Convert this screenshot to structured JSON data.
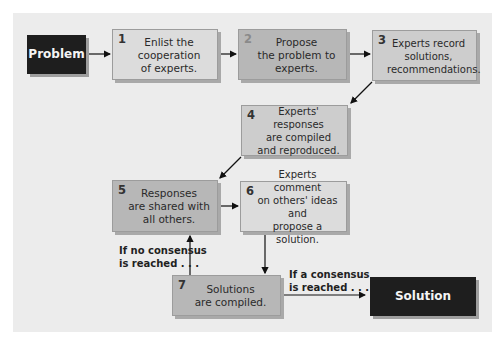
{
  "diagram": {
    "start": {
      "label": "Problem"
    },
    "end": {
      "label": "Solution"
    },
    "steps": [
      {
        "number": "1",
        "text": "Enlist the\ncooperation\nof experts."
      },
      {
        "number": "2",
        "text": "Propose\nthe problem to\nexperts."
      },
      {
        "number": "3",
        "text": "Experts record\nsolutions,\nrecommendations."
      },
      {
        "number": "4",
        "text": "Experts' responses\nare compiled\nand reproduced."
      },
      {
        "number": "5",
        "text": "Responses\nare shared with\nall others."
      },
      {
        "number": "6",
        "text": "Experts comment\non others' ideas and\npropose a solution."
      },
      {
        "number": "7",
        "text": "Solutions\nare compiled."
      }
    ],
    "branches": {
      "no_consensus": "If no consensus\nis reached . . .",
      "consensus": "If a consensus\nis reached . . ."
    },
    "colors": {
      "panel": "#ececec",
      "terminal": "#1e1e1e",
      "step_light": "#dcdcdc",
      "step_mid": "#cdcdcd",
      "step_dark": "#b7b7b7"
    }
  }
}
